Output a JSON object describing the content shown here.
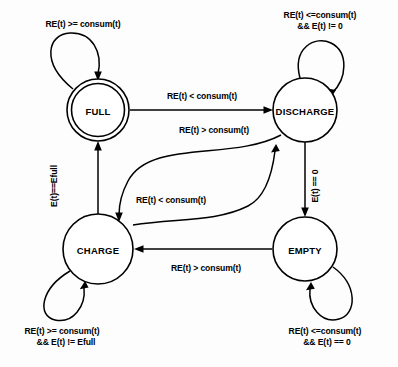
{
  "diagram": {
    "background_color": "#fdfdfd",
    "stroke_color": "#000000",
    "states": [
      {
        "id": "full",
        "label": "FULL",
        "shape": "double-circle",
        "cx": 98,
        "cy": 110,
        "r": 31
      },
      {
        "id": "discharge",
        "label": "DISCHARGE",
        "shape": "circle",
        "cx": 305,
        "cy": 110,
        "r": 32
      },
      {
        "id": "charge",
        "label": "CHARGE",
        "shape": "circle",
        "cx": 98,
        "cy": 249,
        "r": 35
      },
      {
        "id": "empty",
        "label": "EMPTY",
        "shape": "circle",
        "cx": 305,
        "cy": 249,
        "r": 32
      }
    ],
    "transitions": [
      {
        "id": "full-self",
        "from": "full",
        "to": "full",
        "kind": "self-loop",
        "label_lines": [
          "RE(t) >= consum(t)"
        ],
        "label_x": 83,
        "label_y": 27
      },
      {
        "id": "full-to-discharge",
        "from": "full",
        "to": "discharge",
        "kind": "straight",
        "label_lines": [
          "RE(t) < consum(t)"
        ],
        "label_x": 202,
        "label_y": 99
      },
      {
        "id": "discharge-self",
        "from": "discharge",
        "to": "discharge",
        "kind": "self-loop",
        "label_lines": [
          "RE(t) <=consum(t)",
          "&& E(t) != 0"
        ],
        "label_x": 320,
        "label_y": 18
      },
      {
        "id": "discharge-to-charge",
        "from": "discharge",
        "to": "charge",
        "kind": "curve",
        "label_lines": [
          "RE(t) > consum(t)"
        ],
        "label_x": 214,
        "label_y": 133
      },
      {
        "id": "charge-to-discharge",
        "from": "charge",
        "to": "discharge",
        "kind": "curve",
        "label_lines": [
          "RE(t) < consum(t)"
        ],
        "label_x": 171,
        "label_y": 203
      },
      {
        "id": "charge-to-full",
        "from": "charge",
        "to": "full",
        "kind": "straight-vertical",
        "label_lines": [
          "E(t)==Efull"
        ],
        "label_x": 57,
        "label_y": 186,
        "rotated": true
      },
      {
        "id": "discharge-to-empty",
        "from": "discharge",
        "to": "empty",
        "kind": "straight-vertical",
        "label_lines": [
          "E(t) == 0"
        ],
        "label_x": 318,
        "label_y": 186,
        "rotated": true
      },
      {
        "id": "empty-to-charge",
        "from": "empty",
        "to": "charge",
        "kind": "straight",
        "label_lines": [
          "RE(t) > consum(t)"
        ],
        "label_x": 206,
        "label_y": 271
      },
      {
        "id": "charge-self",
        "from": "charge",
        "to": "charge",
        "kind": "self-loop",
        "label_lines": [
          "RE(t) >= consum(t)",
          "&&   E(t) != Efull"
        ],
        "label_x": 62,
        "label_y": 334
      },
      {
        "id": "empty-self",
        "from": "empty",
        "to": "empty",
        "kind": "self-loop",
        "label_lines": [
          "RE(t) <=consum(t)",
          "&&  E(t) == 0"
        ],
        "label_x": 325,
        "label_y": 334
      }
    ]
  }
}
